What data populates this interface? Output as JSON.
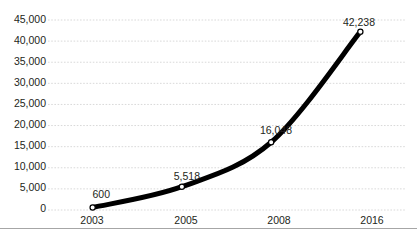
{
  "chart_data": {
    "type": "line",
    "title": "",
    "xlabel": "",
    "ylabel": "",
    "categories": [
      "2003",
      "2005",
      "2008",
      "2016"
    ],
    "values": [
      600,
      5518,
      16048,
      42238
    ],
    "point_labels": [
      "600",
      "5,518",
      "16,048",
      "42,238"
    ],
    "series": [
      {
        "name": "",
        "values": [
          600,
          5518,
          16048,
          42238
        ]
      }
    ],
    "ylim": [
      0,
      45000
    ],
    "y_ticks": [
      0,
      5000,
      10000,
      15000,
      20000,
      25000,
      30000,
      35000,
      40000,
      45000
    ],
    "y_tick_labels": [
      "45,000",
      "40,000",
      "35,000",
      "30,000",
      "25,000",
      "20,000",
      "15,000",
      "10,000",
      "5,000",
      "0"
    ],
    "grid": true,
    "grid_style": "dotted-horizontal",
    "legend": "none",
    "line_color": "#000000",
    "line_width": 5,
    "marker": "circle",
    "marker_fill": "#ffffff",
    "marker_edge": "#000000",
    "smoothing": "spline",
    "grid_color": "#d9d9d9",
    "text_color": "#231f20",
    "background": "#ffffff"
  },
  "ylabels": [
    {
      "text": "45,000",
      "top": 14
    },
    {
      "text": "40,000",
      "top": 35
    },
    {
      "text": "35,000",
      "top": 56
    },
    {
      "text": "30,000",
      "top": 77
    },
    {
      "text": "25,000",
      "top": 98
    },
    {
      "text": "20,000",
      "top": 119
    },
    {
      "text": "15,000",
      "top": 140
    },
    {
      "text": "10,000",
      "top": 161
    },
    {
      "text": "5,000",
      "top": 182
    },
    {
      "text": "0",
      "top": 203
    }
  ],
  "xlabels": [
    {
      "text": "2003",
      "left": 92
    },
    {
      "text": "2005",
      "left": 186
    },
    {
      "text": "2008",
      "left": 279
    },
    {
      "text": "2016",
      "left": 372
    }
  ],
  "point_labels": [
    {
      "text": "600",
      "left": 110,
      "top": 200
    },
    {
      "text": "5,518",
      "left": 200,
      "top": 182
    },
    {
      "text": "16,048",
      "left": 292,
      "top": 136
    },
    {
      "text": "42,238",
      "left": 375,
      "top": 28
    }
  ]
}
